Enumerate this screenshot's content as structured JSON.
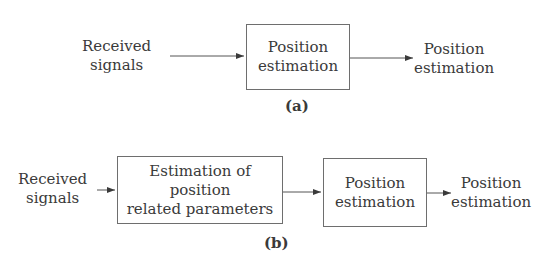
{
  "panel_a": {
    "input_label": "Received\nsignals",
    "box_label": "Position\nestimation",
    "output_label": "Position\nestimation",
    "caption": "(a)"
  },
  "panel_b": {
    "input_label": "Received\nsignals",
    "box1_label": "Estimation of position\nrelated parameters",
    "box2_label": "Position\nestimation",
    "output_label": "Position\nestimation",
    "caption": "(b)"
  }
}
